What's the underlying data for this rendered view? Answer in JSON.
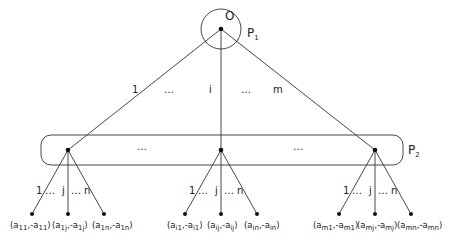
{
  "root": {
    "label": "O",
    "player_label": "P",
    "player_sub": "1"
  },
  "level2_player": {
    "label": "P",
    "sub": "2"
  },
  "top_branches": {
    "first": "1",
    "dots1": "…",
    "middle": "i",
    "dots2": "…",
    "last": "m"
  },
  "middle_dots": [
    "…",
    "…"
  ],
  "subtree_branch_labels": {
    "first": "1",
    "dots1": "…",
    "middle": "j",
    "dots2": "…",
    "last": "n"
  },
  "leaves": [
    {
      "group": "1",
      "labels": [
        {
          "a": "11",
          "b": "11"
        },
        {
          "a": "1j",
          "b": "1j"
        },
        {
          "a": "1n",
          "b": "1n"
        }
      ]
    },
    {
      "group": "i",
      "labels": [
        {
          "a": "i1",
          "b": "i1"
        },
        {
          "a": "ij",
          "b": "ij"
        },
        {
          "a": "in",
          "b": "in"
        }
      ]
    },
    {
      "group": "m",
      "labels": [
        {
          "a": "m1",
          "b": "m1"
        },
        {
          "a": "mj",
          "b": "mj"
        },
        {
          "a": "mn",
          "b": "mn"
        }
      ]
    }
  ],
  "leaf_text": {
    "l0_0": "(a11,-a11)",
    "l0_1": "(a1j,-a1j)",
    "l0_2": "(a1n,-a1n)",
    "l1_0": "(ai1,-ai1)",
    "l1_1": "(aij,-aij)",
    "l1_2": "(ain,-ain)",
    "l2_0": "(am1,-am1)",
    "l2_1": "(amj,-amj)",
    "l2_2": "(amn,-amn)"
  }
}
